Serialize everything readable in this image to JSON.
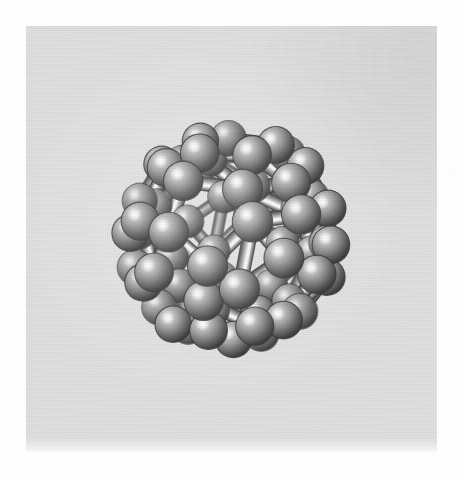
{
  "page": {
    "width": 464,
    "height": 481,
    "background_color": "#fdfdfd",
    "kind": "scanned-book-figure"
  },
  "ghost_text": {
    "top_line": "·  ·  ·   ·  ·  ·   ·  ·  ·   ·  ·",
    "top_line_2": "·· ··· ···· ··· ·· ··· ···· ··· ··",
    "right_line_1": "···",
    "right_line_2": "····",
    "bottom_line": "·  ·  ·  ·  ·  ·  ·"
  },
  "figure": {
    "panel": {
      "x": 26,
      "y": 26,
      "width": 411,
      "height": 426,
      "background_color": "#e3e3e3"
    },
    "caption": "",
    "title": "",
    "molecule_name": "C60 buckminsterfullerene",
    "render_style": "ball-and-stick",
    "palette": {
      "atom_core": "#8f8f8f",
      "atom_highlight": "#f2f2f2",
      "atom_midtone": "#8a8a8a",
      "atom_shadow": "#3c3c3c",
      "atom_rim": "#2f2f2f",
      "bond_light": "#ededed",
      "bond_mid": "#9a9a9a",
      "bond_dark": "#4a4a4a",
      "background": "#e3e3e3"
    }
  },
  "model": {
    "type": "truncated-icosahedron",
    "atom_count": 60,
    "bond_count": 90,
    "atom_radius": 17.5,
    "bond_radius": 6.2,
    "projection": "perspective",
    "perspective_distance": 900,
    "scale": 152,
    "center": {
      "x": 205,
      "y": 212
    },
    "rotation_deg": {
      "x": -16,
      "y": 27,
      "z": 9
    },
    "light_direction": {
      "x": -0.42,
      "y": -0.58,
      "z": 0.7
    }
  },
  "chart_data": {
    "type": "scatter",
    "xlabel": "",
    "ylabel": "",
    "grid": false,
    "legend": null,
    "annotations": [],
    "note": "60 vertices of a truncated icosahedron, 90 edges; 12 pentagonal and 20 hexagonal faces",
    "vertices_unit_sphere": [
      [
        0.0,
        0.33763886,
        0.57154021
      ],
      [
        0.0,
        0.33763886,
        -0.57154021
      ],
      [
        0.0,
        -0.33763886,
        0.57154021
      ],
      [
        0.0,
        -0.33763886,
        -0.57154021
      ],
      [
        0.57154021,
        0.0,
        0.33763886
      ],
      [
        -0.57154021,
        0.0,
        0.33763886
      ],
      [
        0.57154021,
        0.0,
        -0.33763886
      ],
      [
        -0.57154021,
        0.0,
        -0.33763886
      ],
      [
        0.33763886,
        0.57154021,
        0.0
      ],
      [
        0.33763886,
        -0.57154021,
        0.0
      ],
      [
        -0.33763886,
        0.57154021,
        0.0
      ],
      [
        -0.33763886,
        -0.57154021,
        0.0
      ],
      [
        0.16881943,
        0.10434431,
        0.63361279
      ],
      [
        0.16881943,
        -0.10434431,
        0.63361279
      ],
      [
        -0.16881943,
        0.10434431,
        0.63361279
      ],
      [
        -0.16881943,
        -0.10434431,
        0.63361279
      ],
      [
        0.16881943,
        0.10434431,
        -0.63361279
      ],
      [
        0.16881943,
        -0.10434431,
        -0.63361279
      ],
      [
        -0.16881943,
        0.10434431,
        -0.63361279
      ],
      [
        -0.16881943,
        -0.10434431,
        -0.63361279
      ],
      [
        0.63361279,
        0.16881943,
        0.10434431
      ],
      [
        0.63361279,
        0.16881943,
        -0.10434431
      ],
      [
        0.63361279,
        -0.16881943,
        0.10434431
      ],
      [
        0.63361279,
        -0.16881943,
        -0.10434431
      ],
      [
        -0.63361279,
        0.16881943,
        0.10434431
      ],
      [
        -0.63361279,
        0.16881943,
        -0.10434431
      ],
      [
        -0.63361279,
        -0.16881943,
        0.10434431
      ],
      [
        -0.63361279,
        -0.16881943,
        -0.10434431
      ],
      [
        0.10434431,
        0.63361279,
        0.16881943
      ],
      [
        -0.10434431,
        0.63361279,
        0.16881943
      ],
      [
        0.10434431,
        0.63361279,
        -0.16881943
      ],
      [
        -0.10434431,
        0.63361279,
        -0.16881943
      ],
      [
        0.10434431,
        -0.63361279,
        0.16881943
      ],
      [
        -0.10434431,
        -0.63361279,
        0.16881943
      ],
      [
        0.10434431,
        -0.63361279,
        -0.16881943
      ],
      [
        -0.10434431,
        -0.63361279,
        -0.16881943
      ],
      [
        0.27316374,
        0.44195829,
        0.43597772
      ],
      [
        0.27316374,
        0.44195829,
        -0.43597772
      ],
      [
        0.27316374,
        -0.44195829,
        0.43597772
      ],
      [
        0.27316374,
        -0.44195829,
        -0.43597772
      ],
      [
        -0.27316374,
        0.44195829,
        0.43597772
      ],
      [
        -0.27316374,
        0.44195829,
        -0.43597772
      ],
      [
        -0.27316374,
        -0.44195829,
        0.43597772
      ],
      [
        -0.27316374,
        -0.44195829,
        -0.43597772
      ],
      [
        0.43597772,
        0.27316374,
        0.44195829
      ],
      [
        0.43597772,
        0.27316374,
        -0.44195829
      ],
      [
        0.43597772,
        -0.27316374,
        0.44195829
      ],
      [
        0.43597772,
        -0.27316374,
        -0.44195829
      ],
      [
        -0.43597772,
        0.27316374,
        0.44195829
      ],
      [
        -0.43597772,
        0.27316374,
        -0.44195829
      ],
      [
        -0.43597772,
        -0.27316374,
        0.44195829
      ],
      [
        -0.43597772,
        -0.27316374,
        -0.44195829
      ],
      [
        0.44195829,
        0.43597772,
        0.27316374
      ],
      [
        0.44195829,
        0.43597772,
        -0.27316374
      ],
      [
        0.44195829,
        -0.43597772,
        0.27316374
      ],
      [
        0.44195829,
        -0.43597772,
        -0.27316374
      ],
      [
        -0.44195829,
        0.43597772,
        0.27316374
      ],
      [
        -0.44195829,
        0.43597772,
        -0.27316374
      ],
      [
        -0.44195829,
        -0.43597772,
        0.27316374
      ],
      [
        -0.44195829,
        -0.43597772,
        -0.27316374
      ]
    ]
  }
}
